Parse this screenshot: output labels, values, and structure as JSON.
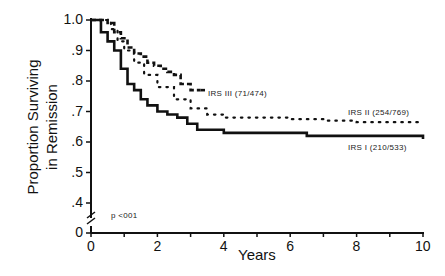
{
  "chart_data": {
    "type": "line",
    "subtype": "kaplan-meier step curves",
    "title": "",
    "xlabel": "Years",
    "ylabel": "Proportion Surviving in Remission",
    "ylabel_lines": [
      "Proportion Surviving",
      "in Remission"
    ],
    "xlim": [
      0,
      10
    ],
    "ylim_display": [
      0.4,
      1.0
    ],
    "y_axis_break": true,
    "x_ticks": [
      0,
      2,
      4,
      6,
      8,
      10
    ],
    "x_minor_ticks": [
      1,
      3,
      5,
      7,
      9
    ],
    "y_ticks": [
      "1.0",
      ".9",
      ".8",
      ".7",
      ".6",
      ".5",
      ".4",
      "0"
    ],
    "grid": false,
    "legend": "inline labels",
    "annotation": "p <001",
    "series": [
      {
        "name": "IRS III (71/474)",
        "style": "dashed",
        "x": [
          0,
          0.5,
          0.7,
          0.9,
          1.1,
          1.3,
          1.5,
          1.7,
          1.9,
          2.1,
          2.3,
          2.5,
          2.7,
          3.0,
          3.3
        ],
        "y": [
          1.0,
          0.99,
          0.96,
          0.94,
          0.91,
          0.89,
          0.88,
          0.86,
          0.85,
          0.84,
          0.83,
          0.82,
          0.79,
          0.77,
          0.77
        ]
      },
      {
        "name": "IRS II (254/769)",
        "style": "dotted",
        "x": [
          0,
          0.6,
          0.8,
          1.0,
          1.3,
          1.6,
          2.0,
          2.5,
          3.0,
          3.5,
          4.0,
          5.0,
          6.0,
          7.0,
          8.0,
          9.0,
          10.0
        ],
        "y": [
          1.0,
          0.97,
          0.93,
          0.9,
          0.86,
          0.82,
          0.78,
          0.74,
          0.71,
          0.69,
          0.68,
          0.68,
          0.675,
          0.67,
          0.665,
          0.665,
          0.665
        ]
      },
      {
        "name": "IRS I (210/533)",
        "style": "solid",
        "x": [
          0,
          0.3,
          0.5,
          0.7,
          0.9,
          1.1,
          1.3,
          1.5,
          1.7,
          2.0,
          2.3,
          2.6,
          2.9,
          3.2,
          4.0,
          5.0,
          6.0,
          6.5,
          8.0,
          9.0,
          10.0
        ],
        "y": [
          1.0,
          0.96,
          0.93,
          0.9,
          0.84,
          0.79,
          0.77,
          0.74,
          0.72,
          0.7,
          0.69,
          0.68,
          0.66,
          0.64,
          0.63,
          0.63,
          0.63,
          0.62,
          0.62,
          0.62,
          0.61
        ]
      }
    ]
  },
  "labels": {
    "series_iii": "IRS III (71/474)",
    "series_ii": "IRS II (254/769)",
    "series_i": "IRS I (210/533)",
    "pvalue": "p <001",
    "xlabel": "Years",
    "ylabel_line1": "Proportion Surviving",
    "ylabel_line2": "in Remission"
  }
}
